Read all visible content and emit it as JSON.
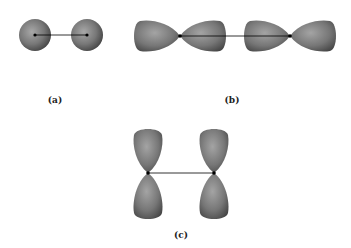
{
  "figure": {
    "panels": [
      {
        "id": "a",
        "label": "(a)",
        "description": "Two s orbitals (spheres) with internuclear axis"
      },
      {
        "id": "b",
        "label": "(b)",
        "description": "Two p orbitals aligned end-to-end along internuclear axis"
      },
      {
        "id": "c",
        "label": "(c)",
        "description": "Two p orbitals parallel, perpendicular to internuclear axis"
      }
    ],
    "colors": {
      "orbital_light": "#9a9a9a",
      "orbital_dark": "#4a4a4a",
      "nucleus": "#000000",
      "bond_line": "#000000"
    }
  }
}
